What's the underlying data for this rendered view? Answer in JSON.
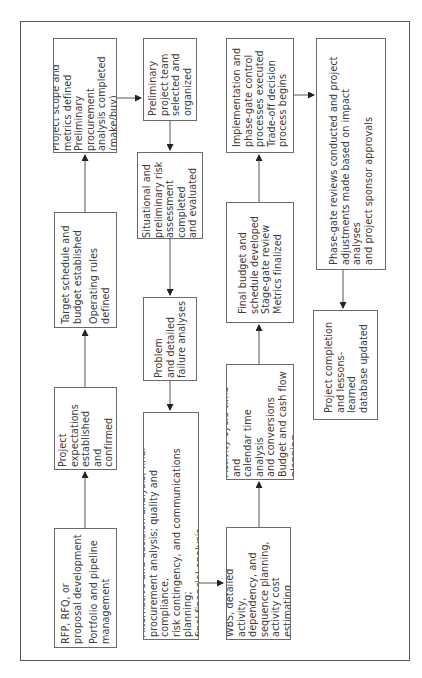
{
  "diagram": {
    "title": "",
    "orientation": "rotated -90deg (read bottom-to-top)",
    "nodes": [
      {
        "id": "rfp",
        "lines_a": "RFP, RFQ, or\nproposal development",
        "lines_b": "Portfolio and pipeline\nmanagement"
      },
      {
        "id": "expectations",
        "lines_a": "Project\nexpectations\nestablished and\nconfirmed"
      },
      {
        "id": "target",
        "lines_a": "Target schedule and\nbudget established",
        "lines_b": "Operating rules\ndefined"
      },
      {
        "id": "scope",
        "lines_a": "Project scope and\nmetrics defined\nPreliminary procurement\nanalysis completed\n(make/buy)"
      },
      {
        "id": "team",
        "lines_a": "Preliminary\nproject team\nselected and\norganized"
      },
      {
        "id": "situational",
        "lines_a": "Situational and\npreliminary risk\nassessment completed\nand evaluated"
      },
      {
        "id": "problem",
        "lines_a": "Problem\nand detailed\nfailure analyses"
      },
      {
        "id": "alternative",
        "lines_a": "Alternative and decision analysis; final\nprocurement analysis; quality and compliance,\nrisk contingency, and communications planning;\nfinal financial analysis"
      },
      {
        "id": "wbs",
        "lines_a": "WBS, detailed activity,\ndependency, and\nsequence planning,\nactivity cost estimating"
      },
      {
        "id": "activity",
        "lines_a": "Activity cycle time and\ncalendar time analysis\nand conversions\nBudget and cash flow\nplanning"
      },
      {
        "id": "finalbudget",
        "lines_a": "Final budget and\nschedule developed\nStage-gate review\nMetrics finalized"
      },
      {
        "id": "implementation",
        "lines_a": "Implementation and\nphase-gate control\nprocesses executed\nTrade-off decision\nprocess begins"
      },
      {
        "id": "phasegate",
        "lines_a": "Phase-gate reviews conducted and project\nadjustments made based on impact analyses\nand project sponsor approvals"
      },
      {
        "id": "completion",
        "lines_a": "Project completion\nand lessons-learned\ndatabase updated"
      }
    ],
    "edges": [
      [
        "rfp",
        "expectations"
      ],
      [
        "expectations",
        "target"
      ],
      [
        "target",
        "scope"
      ],
      [
        "scope",
        "team"
      ],
      [
        "team",
        "situational"
      ],
      [
        "situational",
        "problem"
      ],
      [
        "problem",
        "alternative"
      ],
      [
        "alternative",
        "wbs"
      ],
      [
        "wbs",
        "activity"
      ],
      [
        "activity",
        "finalbudget"
      ],
      [
        "finalbudget",
        "implementation"
      ],
      [
        "implementation",
        "phasegate"
      ],
      [
        "phasegate",
        "completion"
      ]
    ],
    "colors": {
      "line": "#555555",
      "text": "#3c3c3c",
      "background": "#ffffff"
    }
  }
}
